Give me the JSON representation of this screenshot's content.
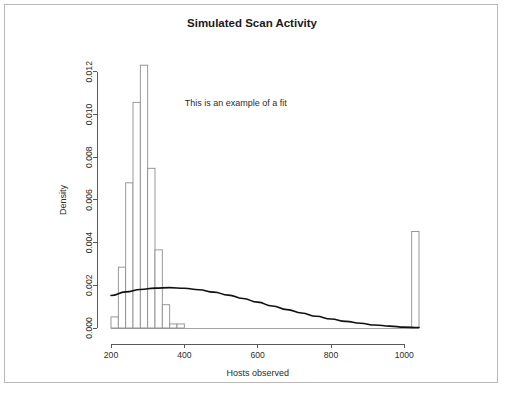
{
  "figure": {
    "border_color": "#b9b9b9",
    "background": "#ffffff"
  },
  "chart_data": {
    "type": "bar",
    "title": "Simulated Scan Activity",
    "xlabel": "Hosts observed",
    "ylabel": "Density",
    "annotation": "This is an example of a fit",
    "annotation_x": 540,
    "annotation_y": 0.0104,
    "grid": false,
    "legend": "none",
    "xlim": [
      200,
      1040
    ],
    "ylim": [
      0,
      0.0126
    ],
    "xticks": [
      200,
      400,
      600,
      800,
      1000
    ],
    "xtick_labels": [
      "200",
      "400",
      "600",
      "800",
      "1000"
    ],
    "yticks": [
      0.0,
      0.002,
      0.004,
      0.006,
      0.008,
      0.01,
      0.012
    ],
    "ytick_labels": [
      "0.000",
      "0.002",
      "0.004",
      "0.006",
      "0.008",
      "0.010",
      "0.012"
    ],
    "bin_width": 20,
    "bar_color": "#ffffff",
    "bar_edge_color": "#8d8d8d",
    "categories": [
      210,
      230,
      250,
      270,
      290,
      310,
      330,
      350,
      370,
      390,
      1030
    ],
    "values": [
      0.00052,
      0.00285,
      0.0068,
      0.01057,
      0.01231,
      0.00748,
      0.00366,
      0.00109,
      0.00019,
      0.00019,
      0.00452
    ],
    "bars": [
      {
        "x0": 200,
        "x1": 220,
        "density": 0.00052
      },
      {
        "x0": 220,
        "x1": 240,
        "density": 0.00285
      },
      {
        "x0": 240,
        "x1": 260,
        "density": 0.0068
      },
      {
        "x0": 260,
        "x1": 280,
        "density": 0.01057
      },
      {
        "x0": 280,
        "x1": 300,
        "density": 0.01231
      },
      {
        "x0": 300,
        "x1": 320,
        "density": 0.00748
      },
      {
        "x0": 320,
        "x1": 340,
        "density": 0.00366
      },
      {
        "x0": 340,
        "x1": 360,
        "density": 0.00109
      },
      {
        "x0": 360,
        "x1": 380,
        "density": 0.00019
      },
      {
        "x0": 380,
        "x1": 400,
        "density": 0.00019
      },
      {
        "x0": 1020,
        "x1": 1040,
        "density": 0.00452
      }
    ],
    "fit_curve": {
      "name": "fitted density",
      "color": "#111111",
      "x": [
        200,
        240,
        280,
        320,
        360,
        400,
        440,
        480,
        520,
        560,
        600,
        640,
        680,
        720,
        760,
        800,
        840,
        880,
        920,
        960,
        1000,
        1040
      ],
      "y": [
        0.00152,
        0.00169,
        0.0018,
        0.00187,
        0.00189,
        0.00186,
        0.00179,
        0.00168,
        0.00154,
        0.00138,
        0.00121,
        0.00103,
        0.00086,
        0.0007,
        0.00055,
        0.00042,
        0.00031,
        0.00022,
        0.00014,
        9e-05,
        4e-05,
        2e-05
      ]
    }
  }
}
